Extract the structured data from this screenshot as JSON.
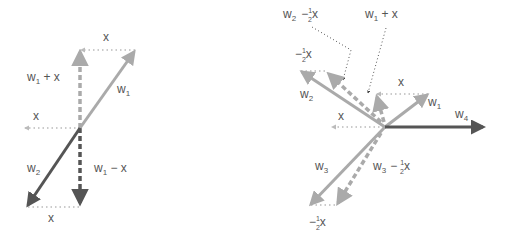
{
  "colors": {
    "light_vector": "#aaaaaa",
    "dark_vector": "#555555",
    "dotted": "#b5b5b5",
    "pointer": "#555555",
    "label": "#555555"
  },
  "left_diagram": {
    "origin": [
      80,
      128
    ],
    "vectors": [
      {
        "name": "w1",
        "from": [
          80,
          128
        ],
        "to": [
          135,
          50
        ],
        "style": "solid-light"
      },
      {
        "name": "w2",
        "from": [
          80,
          128
        ],
        "to": [
          27,
          207
        ],
        "style": "solid-dark"
      },
      {
        "name": "w1 + x",
        "from": [
          80,
          128
        ],
        "to": [
          80,
          50
        ],
        "style": "dashed-light"
      },
      {
        "name": "w1 - x",
        "from": [
          80,
          128
        ],
        "to": [
          80,
          205
        ],
        "style": "dashed-dark"
      },
      {
        "name": "x (top)",
        "from": [
          135,
          50
        ],
        "to": [
          80,
          50
        ],
        "style": "dotted"
      },
      {
        "name": "x (mid)",
        "from": [
          80,
          128
        ],
        "to": [
          27,
          128
        ],
        "style": "dotted"
      },
      {
        "name": "x (bottom)",
        "from": [
          27,
          207
        ],
        "to": [
          80,
          207
        ],
        "style": "dotted"
      }
    ],
    "labels": {
      "x_top": "x",
      "w1_plus_x_main": "w",
      "w1_plus_x_sub": "1",
      "w1_plus_x_rest": " + x",
      "w1_main": "w",
      "w1_sub": "1",
      "x_mid": "x",
      "w2_main": "w",
      "w2_sub": "2",
      "w1_minus_x_main": "w",
      "w1_minus_x_sub": "1",
      "w1_minus_x_rest": " − x",
      "x_bottom": "x"
    }
  },
  "right_diagram": {
    "origin": [
      385,
      127
    ],
    "vectors": [
      {
        "name": "w1",
        "from": [
          385,
          127
        ],
        "to": [
          428,
          94
        ],
        "style": "solid-light"
      },
      {
        "name": "w2",
        "from": [
          385,
          127
        ],
        "to": [
          300,
          71
        ],
        "style": "solid-light"
      },
      {
        "name": "w3",
        "from": [
          385,
          127
        ],
        "to": [
          310,
          205
        ],
        "style": "solid-light"
      },
      {
        "name": "w4",
        "from": [
          385,
          127
        ],
        "to": [
          485,
          127
        ],
        "style": "solid-dark"
      },
      {
        "name": "w1 + x",
        "from": [
          383,
          122
        ],
        "to": [
          376,
          95
        ],
        "style": "dashed-light"
      },
      {
        "name": "w2 - 1/2 x",
        "from": [
          380,
          122
        ],
        "to": [
          327,
          72
        ],
        "style": "dashed-light"
      },
      {
        "name": "w3 - 1/2 x",
        "from": [
          380,
          132
        ],
        "to": [
          337,
          205
        ],
        "style": "dashed-light"
      }
    ],
    "labels": {
      "w2_minus_half_x_main": "w",
      "w2_minus_half_x_sub": "2",
      "w1_plus_x_main": "w",
      "w1_plus_x_sub": "1",
      "w1_plus_x_rest": " + x",
      "neg_half_x_top_sign": "−",
      "half_num": "1",
      "half_den": "2",
      "x": "x",
      "x_w1": "x",
      "w2_main": "w",
      "w2_sub": "2",
      "w1_main": "w",
      "w1_sub": "1",
      "w4_main": "w",
      "w4_sub": "4",
      "x_mid": "x",
      "w3_main": "w",
      "w3_sub": "3",
      "w3_minus_half_x_main": "w",
      "w3_minus_half_x_sub": "3",
      "minus": "−"
    }
  }
}
